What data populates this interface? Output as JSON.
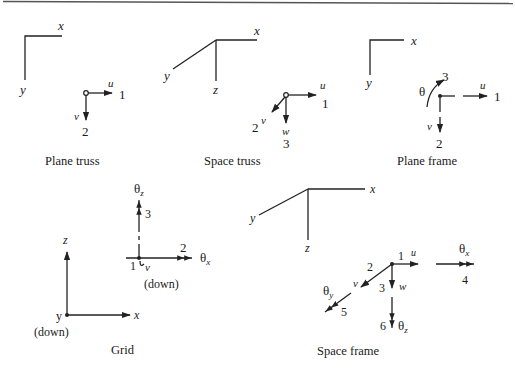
{
  "figure": {
    "panels": [
      {
        "id": "plane-truss",
        "caption": "Plane truss",
        "axes": {
          "x": "x",
          "y": "y"
        },
        "dofs": [
          {
            "num": "1",
            "symbol": "u",
            "direction": "right"
          },
          {
            "num": "2",
            "symbol": "v",
            "direction": "down"
          }
        ]
      },
      {
        "id": "space-truss",
        "caption": "Space truss",
        "axes": {
          "x": "x",
          "y": "y",
          "z": "z"
        },
        "dofs": [
          {
            "num": "1",
            "symbol": "u",
            "direction": "right"
          },
          {
            "num": "2",
            "symbol": "v",
            "direction": "down-left"
          },
          {
            "num": "3",
            "symbol": "w",
            "direction": "down"
          }
        ]
      },
      {
        "id": "plane-frame",
        "caption": "Plane frame",
        "axes": {
          "x": "x",
          "y": "y"
        },
        "dofs": [
          {
            "num": "1",
            "symbol": "u",
            "direction": "right"
          },
          {
            "num": "2",
            "symbol": "v",
            "direction": "down"
          },
          {
            "num": "3",
            "symbol": "θ",
            "direction": "rotation"
          }
        ]
      },
      {
        "id": "grid",
        "caption": "Grid",
        "axes": {
          "x": "x",
          "y": "y",
          "z": "z",
          "y_note": "(down)"
        },
        "dofs": [
          {
            "num": "1",
            "symbol": "v",
            "note": "(down)"
          },
          {
            "num": "2",
            "symbol": "θx",
            "sub": "x"
          },
          {
            "num": "3",
            "symbol": "θz",
            "sub": "z"
          }
        ]
      },
      {
        "id": "space-frame",
        "caption": "Space frame",
        "axes": {
          "x": "x",
          "y": "y",
          "z": "z"
        },
        "dofs": [
          {
            "num": "1",
            "symbol": "u"
          },
          {
            "num": "2",
            "symbol": "v"
          },
          {
            "num": "3",
            "symbol": "w"
          },
          {
            "num": "4",
            "symbol": "θx",
            "sub": "x"
          },
          {
            "num": "5",
            "symbol": "θy",
            "sub": "y"
          },
          {
            "num": "6",
            "symbol": "θz",
            "sub": "z"
          }
        ]
      }
    ],
    "labels": {
      "theta": "θ",
      "down": "(down)"
    }
  }
}
